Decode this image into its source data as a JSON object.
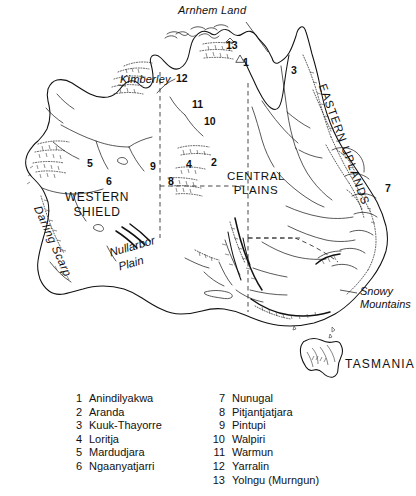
{
  "figure": {
    "background_color": "#ffffff",
    "line_color": "#111111"
  },
  "map": {
    "regions": [
      {
        "id": "western-shield",
        "line1": "WESTERN",
        "line2": "SHIELD"
      },
      {
        "id": "central-plains",
        "line1": "CENTRAL",
        "line2": "PLAINS"
      },
      {
        "id": "eastern-uplands",
        "label": "EASTERN UPLANDS"
      },
      {
        "id": "tasmania",
        "label": "TASMANIA"
      }
    ],
    "features": [
      {
        "id": "arnhem-land",
        "label": "Arnhem Land"
      },
      {
        "id": "kimberley",
        "label": "Kimberley"
      },
      {
        "id": "darling-scarp",
        "label": "Darling Scarp"
      },
      {
        "id": "nullarbor-plain",
        "line1": "Nullarbor",
        "line2": "Plain"
      },
      {
        "id": "snowy-mountains",
        "line1": "Snowy",
        "line2": "Mountains"
      }
    ],
    "markers": [
      {
        "id": "marker-1",
        "number": "1",
        "x": 243,
        "y": 62
      },
      {
        "id": "marker-2",
        "number": "2",
        "x": 211,
        "y": 162
      },
      {
        "id": "marker-3",
        "number": "3",
        "x": 293,
        "y": 70
      },
      {
        "id": "marker-4",
        "number": "4",
        "x": 186,
        "y": 164
      },
      {
        "id": "marker-5",
        "number": "5",
        "x": 87,
        "y": 163
      },
      {
        "id": "marker-6",
        "number": "6",
        "x": 107,
        "y": 181
      },
      {
        "id": "marker-7",
        "number": "7",
        "x": 386,
        "y": 188
      },
      {
        "id": "marker-8",
        "number": "8",
        "x": 169,
        "y": 181
      },
      {
        "id": "marker-9",
        "number": "9",
        "x": 151,
        "y": 166
      },
      {
        "id": "marker-10",
        "number": "10",
        "x": 208,
        "y": 121
      },
      {
        "id": "marker-11",
        "number": "11",
        "x": 196,
        "y": 104
      },
      {
        "id": "marker-12",
        "number": "12",
        "x": 179,
        "y": 79
      },
      {
        "id": "marker-13",
        "number": "13",
        "x": 231,
        "y": 45
      }
    ]
  },
  "legend": {
    "left_column": [
      {
        "number": "1",
        "name": "Anindilyakwa"
      },
      {
        "number": "2",
        "name": "Aranda"
      },
      {
        "number": "3",
        "name": "Kuuk-Thayorre"
      },
      {
        "number": "4",
        "name": "Loritja"
      },
      {
        "number": "5",
        "name": "Mardudjara"
      },
      {
        "number": "6",
        "name": "Ngaanyatjarri"
      }
    ],
    "right_column": [
      {
        "number": "7",
        "name": "Nunugal"
      },
      {
        "number": "8",
        "name": "Pitjantjatjara"
      },
      {
        "number": "9",
        "name": "Pintupi"
      },
      {
        "number": "10",
        "name": "Walpiri"
      },
      {
        "number": "11",
        "name": "Warmun"
      },
      {
        "number": "12",
        "name": "Yarralin"
      },
      {
        "number": "13",
        "name": "Yolngu (Murngun)"
      }
    ]
  }
}
